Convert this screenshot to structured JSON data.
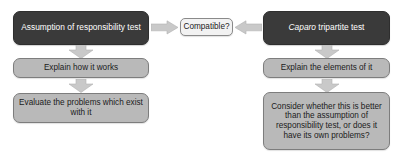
{
  "diagram": {
    "type": "flowchart",
    "title": "",
    "background_color": "#ffffff",
    "colors": {
      "dark_node_fill": "#3a3a3a",
      "dark_node_text": "#ffffff",
      "gray_node_fill": "#b9b9b9",
      "gray_node_border": "#7d7d7d",
      "light_node_fill": "#f2f2f2",
      "light_node_border": "#8a8a8a",
      "arrow_fill": "#c9c9c9",
      "arrow_stroke": "#b0b0b0"
    },
    "branches": {
      "left": {
        "name": "assumption-of-responsibility-branch",
        "nodes": [
          {
            "id": "assumption",
            "label": "Assumption of responsibility test",
            "style": "dark"
          },
          {
            "id": "explain-left",
            "label": "Explain how it works",
            "style": "gray"
          },
          {
            "id": "evaluate",
            "label": "Evaluate the problems which exist with it",
            "style": "gray"
          }
        ]
      },
      "right": {
        "name": "caparo-tripartite-branch",
        "nodes": [
          {
            "id": "caparo",
            "label_italic": "Caparo",
            "label_rest": " tripartite test",
            "label": "Caparo tripartite test",
            "style": "dark"
          },
          {
            "id": "explain-right",
            "label": "Explain the elements of it",
            "style": "gray"
          },
          {
            "id": "consider",
            "label": "Consider whether this is better than the assumption of responsibility test, or does it have its own problems?",
            "style": "gray"
          }
        ]
      },
      "center": {
        "name": "comparison-node",
        "nodes": [
          {
            "id": "compatible",
            "label": "Compatible?",
            "style": "light"
          }
        ]
      }
    },
    "arrows": [
      {
        "id": "assumption-to-compatible",
        "from": "assumption",
        "to": "compatible",
        "direction": "right"
      },
      {
        "id": "caparo-to-compatible",
        "from": "caparo",
        "to": "compatible",
        "direction": "left"
      },
      {
        "id": "assumption-to-explain-left",
        "from": "assumption",
        "to": "explain-left",
        "direction": "down"
      },
      {
        "id": "explain-left-to-evaluate",
        "from": "explain-left",
        "to": "evaluate",
        "direction": "down"
      },
      {
        "id": "caparo-to-explain-right",
        "from": "caparo",
        "to": "explain-right",
        "direction": "down"
      },
      {
        "id": "explain-right-to-consider",
        "from": "explain-right",
        "to": "consider",
        "direction": "down"
      }
    ]
  }
}
